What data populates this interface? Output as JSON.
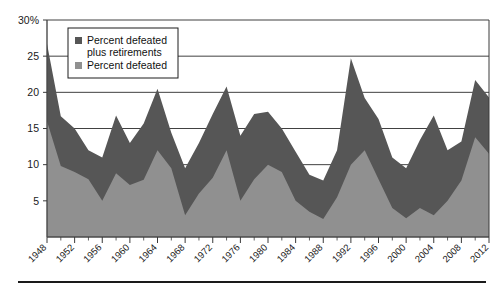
{
  "chart_data": {
    "type": "area",
    "stacked": true,
    "title": "",
    "subtitle": "",
    "xlabel": "",
    "ylabel": "",
    "ylim": [
      0,
      30
    ],
    "xlim": [
      1948,
      2012
    ],
    "grid": true,
    "legend_position": "top-left-inside",
    "y_ticks": [
      5,
      10,
      15,
      20,
      25,
      30
    ],
    "y_tick_labels": [
      "5",
      "10",
      "15",
      "20",
      "25",
      "30%"
    ],
    "x_ticks": [
      1948,
      1952,
      1956,
      1960,
      1964,
      1968,
      1972,
      1976,
      1980,
      1984,
      1988,
      1992,
      1996,
      2000,
      2004,
      2008,
      2012
    ],
    "x_tick_labels": [
      "1948",
      "1952",
      "1956",
      "1960",
      "1964",
      "1968",
      "1972",
      "1976",
      "1980",
      "1984",
      "1988",
      "1992",
      "1996",
      "2000",
      "2004",
      "2008",
      "2012"
    ],
    "x_minor_step": 2,
    "colors": {
      "percent_defeated_plus_retirements": "#565656",
      "percent_defeated": "#909090",
      "plot_background": "#ffffff",
      "axis": "#4a4a4a",
      "gridline": "#2b2b2b",
      "text": "#1a1a1a"
    },
    "x": [
      1948,
      1950,
      1952,
      1954,
      1956,
      1958,
      1960,
      1962,
      1964,
      1966,
      1968,
      1970,
      1972,
      1974,
      1976,
      1978,
      1980,
      1982,
      1984,
      1986,
      1988,
      1990,
      1992,
      1994,
      1996,
      1998,
      2000,
      2002,
      2004,
      2006,
      2008,
      2010,
      2012
    ],
    "series": [
      {
        "name": "Percent defeated plus retirements",
        "key": "total",
        "color": "#565656",
        "values": [
          26.7,
          16.7,
          15.0,
          12.0,
          11.0,
          16.8,
          13.0,
          15.7,
          20.5,
          14.4,
          9.5,
          13.0,
          17.0,
          20.8,
          14.0,
          17.0,
          17.3,
          15.0,
          11.8,
          8.6,
          7.8,
          12.0,
          24.7,
          19.2,
          16.3,
          11.0,
          9.5,
          13.4,
          16.8,
          12.0,
          13.2,
          21.7,
          19.3
        ]
      },
      {
        "name": "Percent defeated",
        "key": "defeated",
        "color": "#909090",
        "values": [
          16.0,
          9.8,
          9.0,
          8.0,
          5.0,
          8.8,
          7.2,
          7.9,
          12.0,
          9.5,
          3.0,
          6.0,
          8.2,
          12.0,
          5.0,
          8.0,
          10.0,
          9.0,
          5.0,
          3.5,
          2.5,
          5.5,
          10.0,
          12.0,
          8.0,
          4.0,
          2.6,
          4.0,
          3.0,
          5.0,
          7.8,
          13.8,
          11.5
        ]
      }
    ],
    "legend": [
      {
        "label_line1": "Percent defeated",
        "label_line2": "plus retirements",
        "color": "#565656",
        "swatch": "square-swatch"
      },
      {
        "label_line1": "Percent defeated",
        "label_line2": "",
        "color": "#909090",
        "swatch": "square-swatch"
      }
    ]
  }
}
